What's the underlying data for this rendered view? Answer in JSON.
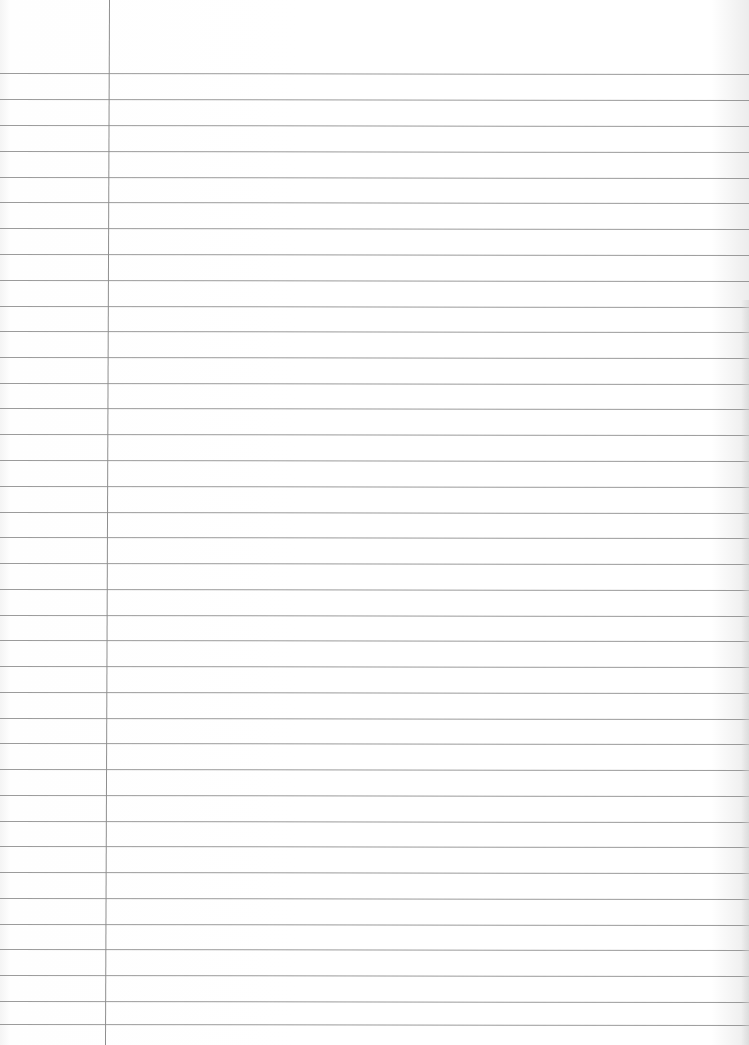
{
  "page": {
    "type": "lined-notebook-paper",
    "content": "",
    "colors": {
      "paper": "#ffffff",
      "rule_line": "#8a8a8a",
      "margin_line": "#8e8e8e"
    },
    "margin_line_x": 109,
    "rule_lines_y": [
      73,
      99,
      125,
      151,
      177,
      202,
      228,
      254,
      280,
      306,
      331,
      357,
      383,
      408,
      434,
      460,
      486,
      512,
      537,
      563,
      589,
      615,
      640,
      666,
      692,
      718,
      743,
      769,
      795,
      821,
      846,
      872,
      898,
      924,
      949,
      975,
      1001,
      1024
    ]
  }
}
